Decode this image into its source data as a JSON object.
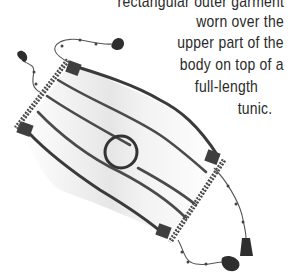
{
  "caption": {
    "lines": [
      "rectangular outer garment",
      "worn over the",
      "upper part of the",
      "body on top of a",
      "full-length",
      "tunic."
    ]
  },
  "illustration": {
    "subject": "rectangular-garment-with-tassels",
    "colors": {
      "outline": "#3a3a3a",
      "corner_patch": "#3f3f3f",
      "fabric": "#ffffff",
      "shade": "#e4e4e4",
      "fringe": "#4a4a4a",
      "tassel": "#2e2e2e"
    }
  }
}
